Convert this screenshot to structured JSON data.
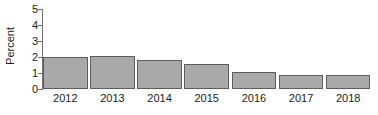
{
  "chart_data": {
    "type": "bar",
    "title": "",
    "subtitle": "",
    "xlabel": "",
    "ylabel": "Percent",
    "categories": [
      "2012",
      "2013",
      "2014",
      "2015",
      "2016",
      "2017",
      "2018"
    ],
    "values": [
      2.0,
      2.05,
      1.8,
      1.55,
      1.05,
      0.88,
      0.88
    ],
    "series": [
      {
        "name": "Percent",
        "values": [
          2.0,
          2.05,
          1.8,
          1.55,
          1.05,
          0.88,
          0.88
        ]
      }
    ],
    "ylim": [
      0,
      5
    ],
    "yticks": [
      0,
      1,
      2,
      3,
      4,
      5
    ],
    "ytick_labels": [
      "0",
      "1",
      "2",
      "3",
      "4",
      "5"
    ],
    "xtick_labels": [
      "2012",
      "2013",
      "2014",
      "2015",
      "2016",
      "2017",
      "2018"
    ],
    "grid": false,
    "legend": false,
    "legend_position": "none",
    "bar_fill_color": "#a9a9a9",
    "bar_edge_color": "#5d5d5d",
    "axis_color": "#6e6e6e",
    "text_color": "#1a1a1a",
    "background_color": "#ffffff"
  }
}
